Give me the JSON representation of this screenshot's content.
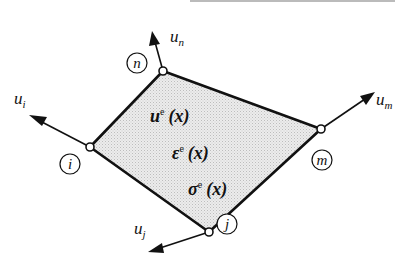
{
  "diagram": {
    "type": "finite-element",
    "element": {
      "fill_color": "#e2e2e2",
      "edge_color": "#111111",
      "field_labels": [
        {
          "symbol": "u",
          "superscript": "e",
          "argument": "(x)"
        },
        {
          "symbol": "ε",
          "superscript": "e",
          "argument": "(x)"
        },
        {
          "symbol": "σ",
          "superscript": "e",
          "argument": "(x)"
        }
      ]
    },
    "nodes": [
      {
        "id": "n",
        "label": "n",
        "displacement": {
          "symbol": "u",
          "subscript": "n"
        }
      },
      {
        "id": "i",
        "label": "i",
        "displacement": {
          "symbol": "u",
          "subscript": "i"
        }
      },
      {
        "id": "m",
        "label": "m",
        "displacement": {
          "symbol": "u",
          "subscript": "m"
        }
      },
      {
        "id": "j",
        "label": "j",
        "displacement": {
          "symbol": "u",
          "subscript": "j"
        }
      }
    ]
  }
}
